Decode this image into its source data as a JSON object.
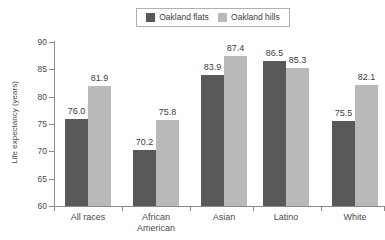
{
  "chart_data": {
    "type": "bar",
    "title": "",
    "xlabel": "",
    "ylabel": "Life expectancy (years)",
    "ylim": [
      60,
      90
    ],
    "yticks": [
      60,
      65,
      70,
      75,
      80,
      85,
      90
    ],
    "grid": false,
    "legend_position": "top-center",
    "categories": [
      "All races",
      "African American",
      "Asian",
      "Latino",
      "White"
    ],
    "category_lines": [
      [
        "All races"
      ],
      [
        "African",
        "American"
      ],
      [
        "Asian"
      ],
      [
        "Latino"
      ],
      [
        "White"
      ]
    ],
    "series": [
      {
        "name": "Oakland flats",
        "color": "#595959",
        "values": [
          76.0,
          70.2,
          83.9,
          86.5,
          75.5
        ],
        "labels": [
          "76.0",
          "70.2",
          "83.9",
          "86.5",
          "75.5"
        ]
      },
      {
        "name": "Oakland hills",
        "color": "#b9b9b9",
        "values": [
          81.9,
          75.8,
          87.4,
          85.3,
          82.1
        ],
        "labels": [
          "81.9",
          "75.8",
          "87.4",
          "85.3",
          "82.1"
        ]
      }
    ]
  },
  "legend": {
    "entries": [
      {
        "label": "Oakland flats",
        "color": "#595959"
      },
      {
        "label": "Oakland hills",
        "color": "#b9b9b9"
      }
    ]
  },
  "axes": {
    "y_title": "Life expectancy (years)",
    "y_tick_labels": [
      "90",
      "85",
      "80",
      "75",
      "70",
      "65",
      "60"
    ]
  }
}
